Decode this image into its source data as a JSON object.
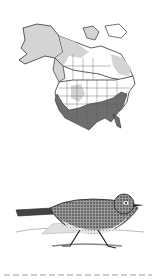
{
  "figure": {
    "map": {
      "subject": "North America range map",
      "legend": {
        "year_round": {
          "label": "Year-round / winter range",
          "color": "#6e6e6e"
        },
        "breeding": {
          "label": "Breeding range",
          "color": "#d4d4d4"
        },
        "land": {
          "label": "No range",
          "color": "#ffffff"
        },
        "border": {
          "color": "#333333"
        }
      }
    },
    "illustration": {
      "subject": "bird-illustration",
      "style": "engraving"
    },
    "caption": ""
  }
}
